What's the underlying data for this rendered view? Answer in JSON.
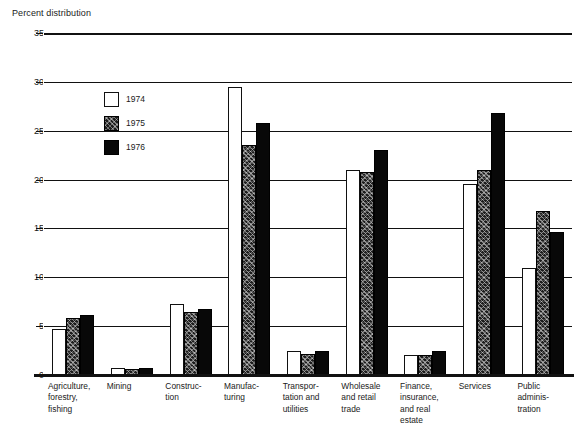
{
  "chart_data": {
    "type": "bar",
    "title": "Percent distribution",
    "xlabel": "",
    "ylabel": "Percent distribution",
    "ylim": [
      0,
      35
    ],
    "ytick_labels": [
      "35",
      "30",
      "25",
      "20",
      "15",
      "10",
      "5",
      "0"
    ],
    "ytick_values": [
      35,
      30,
      25,
      20,
      15,
      10,
      5,
      0
    ],
    "grid": true,
    "legend_position": "upper-left-inside",
    "categories": [
      "Agriculture, forestry, fishing",
      "Mining",
      "Construction",
      "Manufacturing",
      "Transportation and utilities",
      "Wholesale and retail trade",
      "Finance, insurance, and real estate",
      "Services",
      "Public administration"
    ],
    "category_lines": [
      [
        "Agriculture,",
        "forestry,",
        "fishing"
      ],
      [
        "Mining"
      ],
      [
        "Construc-",
        "tion"
      ],
      [
        "Manufac-",
        "turing"
      ],
      [
        "Transpor-",
        "tation and",
        "utilities"
      ],
      [
        "Wholesale",
        "and retail",
        "trade"
      ],
      [
        "Finance,",
        "insurance,",
        "and real",
        "estate"
      ],
      [
        "Services"
      ],
      [
        "Public",
        "adminis-",
        "tration"
      ]
    ],
    "series": [
      {
        "name": "1974",
        "fill": "white",
        "color": "#ffffff",
        "values": [
          4.7,
          0.7,
          7.3,
          29.5,
          2.5,
          21.0,
          2.0,
          19.5,
          11.0
        ]
      },
      {
        "name": "1975",
        "fill": "hatched",
        "color": "#1c1c1c",
        "values": [
          5.8,
          0.6,
          6.5,
          23.5,
          2.2,
          20.8,
          2.0,
          21.0,
          16.8
        ]
      },
      {
        "name": "1976",
        "fill": "solid",
        "color": "#080808",
        "values": [
          6.1,
          0.7,
          6.8,
          25.8,
          2.5,
          23.0,
          2.5,
          26.8,
          14.6
        ]
      }
    ]
  }
}
